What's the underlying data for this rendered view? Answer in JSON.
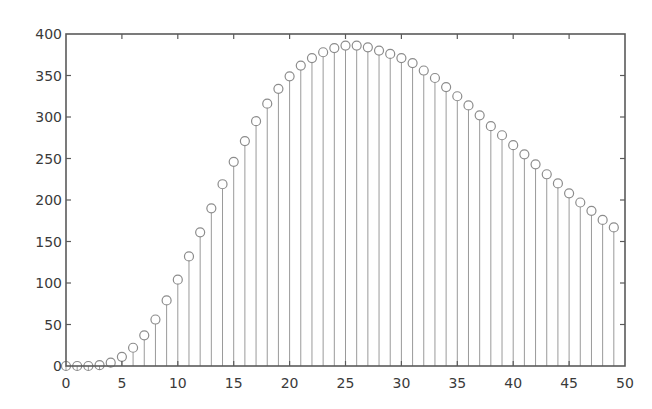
{
  "chart_data": {
    "type": "stem",
    "title": "",
    "xlabel": "",
    "ylabel": "",
    "xlim": [
      0,
      50
    ],
    "ylim": [
      0,
      400
    ],
    "grid": false,
    "legend": null,
    "x_ticks": [
      0,
      5,
      10,
      15,
      20,
      25,
      30,
      35,
      40,
      45,
      50
    ],
    "y_ticks": [
      0,
      50,
      100,
      150,
      200,
      250,
      300,
      350,
      400
    ],
    "x_tick_labels": [
      "0",
      "5",
      "10",
      "15",
      "20",
      "25",
      "30",
      "35",
      "40",
      "45",
      "50"
    ],
    "y_tick_labels": [
      "0",
      "50",
      "100",
      "150",
      "200",
      "250",
      "300",
      "350",
      "400"
    ],
    "marker": "circle",
    "series": [
      {
        "name": "",
        "x": [
          0,
          1,
          2,
          3,
          4,
          5,
          6,
          7,
          8,
          9,
          10,
          11,
          12,
          13,
          14,
          15,
          16,
          17,
          18,
          19,
          20,
          21,
          22,
          23,
          24,
          25,
          26,
          27,
          28,
          29,
          30,
          31,
          32,
          33,
          34,
          35,
          36,
          37,
          38,
          39,
          40,
          41,
          42,
          43,
          44,
          45,
          46,
          47,
          48,
          49
        ],
        "values": [
          0,
          0,
          0,
          1,
          4,
          11,
          22,
          37,
          56,
          79,
          104,
          132,
          161,
          190,
          219,
          246,
          271,
          295,
          316,
          334,
          349,
          362,
          371,
          378,
          383,
          386,
          386,
          384,
          380,
          376,
          371,
          365,
          356,
          347,
          336,
          325,
          314,
          302,
          289,
          278,
          266,
          255,
          243,
          231,
          220,
          208,
          197,
          187,
          176,
          167
        ]
      }
    ]
  },
  "style": {
    "axis_color": "#5a5a5a",
    "stem_color": "#9a9a9a",
    "marker_color": "#8c8c8c",
    "text_color": "#3a3a3a"
  }
}
